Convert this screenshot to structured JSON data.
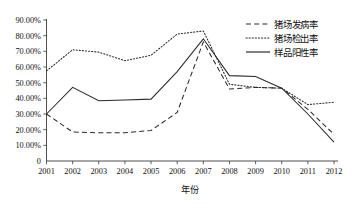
{
  "chart_data": {
    "type": "line",
    "title": "",
    "xlabel": "年份",
    "ylabel": "",
    "categories": [
      "2001",
      "2002",
      "2003",
      "2004",
      "2005",
      "2006",
      "2007",
      "2008",
      "2009",
      "2010",
      "2011",
      "2012"
    ],
    "x": [
      2001,
      2002,
      2003,
      2004,
      2005,
      2006,
      2007,
      2008,
      2009,
      2010,
      2011,
      2012
    ],
    "ylim": [
      0,
      90
    ],
    "ytick_labels": [
      "90.00%",
      "80.00%",
      "70.00%",
      "60.00%",
      "50.00%",
      "40.00%",
      "30.00%",
      "20.00%",
      "10.00%",
      "0"
    ],
    "ytick_values": [
      90,
      80,
      70,
      60,
      50,
      40,
      30,
      20,
      10,
      0
    ],
    "grid": false,
    "legend_position": "top-right",
    "series": [
      {
        "name": "猪场发病率",
        "style": "dashed",
        "values": [
          30.0,
          18.5,
          18.0,
          18.0,
          19.5,
          31.0,
          76.0,
          46.0,
          47.0,
          46.5,
          33.0,
          17.0
        ]
      },
      {
        "name": "猪场检出率",
        "style": "dotted",
        "values": [
          57.5,
          71.0,
          69.5,
          64.0,
          67.5,
          81.0,
          83.0,
          49.0,
          47.0,
          46.5,
          36.0,
          37.5
        ]
      },
      {
        "name": "样品阳性率",
        "style": "solid",
        "values": [
          30.0,
          47.0,
          38.5,
          39.0,
          39.5,
          57.0,
          78.0,
          54.5,
          54.0,
          46.5,
          30.0,
          12.0
        ]
      }
    ]
  },
  "legend": {
    "items": [
      {
        "label": "猪场发病率",
        "style": "dashed"
      },
      {
        "label": "猪场检出率",
        "style": "dotted"
      },
      {
        "label": "样品阳性率",
        "style": "solid"
      }
    ]
  }
}
